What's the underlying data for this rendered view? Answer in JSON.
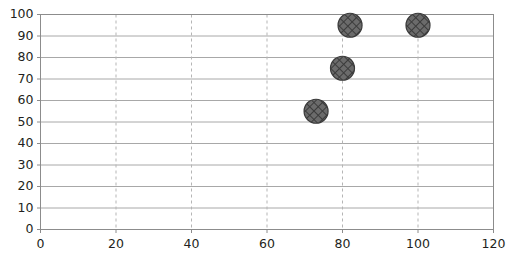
{
  "chart_data": {
    "type": "scatter",
    "title": "",
    "xlabel": "",
    "ylabel": "",
    "xlim": [
      0,
      120
    ],
    "ylim": [
      0,
      100
    ],
    "xticks": [
      0,
      20,
      40,
      60,
      80,
      100,
      120
    ],
    "yticks": [
      0,
      10,
      20,
      30,
      40,
      50,
      60,
      70,
      80,
      90,
      100
    ],
    "xtick_labels": [
      "0",
      "20",
      "40",
      "60",
      "80",
      "100",
      "120"
    ],
    "ytick_labels": [
      "0",
      "10",
      "20",
      "30",
      "40",
      "50",
      "60",
      "70",
      "80",
      "90",
      "100"
    ],
    "grid": {
      "horizontal": "solid",
      "vertical": "dashed",
      "horizontal_color": "#a8a8a8",
      "vertical_color": "#b5b5b5"
    },
    "legend": null,
    "series": [
      {
        "name": "series-1",
        "marker": "circle-crosshatch",
        "marker_color": "#4f4f4f",
        "marker_edge_color": "#3a3a3a",
        "marker_size": 24,
        "points": [
          {
            "x": 73,
            "y": 55
          },
          {
            "x": 80,
            "y": 75
          },
          {
            "x": 82,
            "y": 95
          },
          {
            "x": 100,
            "y": 95
          }
        ]
      }
    ]
  },
  "colors": {
    "axis": "#8c8c8c",
    "text": "#231f20",
    "background": "#ffffff"
  }
}
